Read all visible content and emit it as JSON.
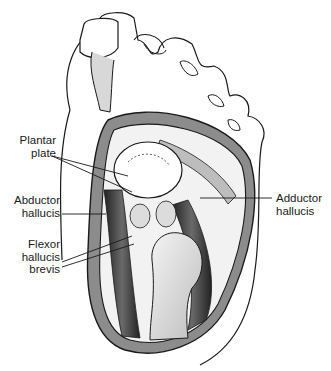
{
  "figure": {
    "colors": {
      "ink": "#1a1a1a",
      "capsule_fill": "#8c8c8c",
      "muscle_dark": "#3a3a3a",
      "bone_light": "#e8e8e8",
      "background": "#ffffff"
    }
  },
  "labels": [
    {
      "id": "plantar-plate",
      "text": "Plantar\nplate",
      "x": 14,
      "y": 138,
      "align": "right"
    },
    {
      "id": "abductor-hallucis",
      "text": "Abductor\nhallucis",
      "x": 14,
      "y": 196,
      "align": "right"
    },
    {
      "id": "flexor-hallucis-brevis",
      "text": "Flexor\nhallucis\nbrevis",
      "x": 26,
      "y": 238,
      "align": "right"
    },
    {
      "id": "adductor-hallucis",
      "text": "Adductor\nhallucis",
      "x": 278,
      "y": 194,
      "align": "left"
    }
  ]
}
